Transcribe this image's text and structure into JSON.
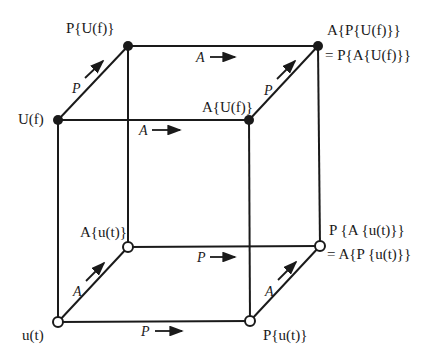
{
  "diagram": {
    "title": "",
    "vertices": {
      "top_front_left": {
        "label": "U(f)",
        "style": "filled"
      },
      "top_back_left": {
        "label": "P{U(f)}",
        "style": "filled"
      },
      "top_front_right": {
        "label": "A{U(f)}",
        "style": "filled"
      },
      "top_back_right": {
        "label_line1": "A{P{U(f)}}",
        "label_line2": "= P{A{U(f)}}",
        "style": "filled"
      },
      "bottom_front_left": {
        "label": "u(t)",
        "style": "open"
      },
      "bottom_back_left": {
        "label": "A{u(t)}",
        "style": "open"
      },
      "bottom_front_right": {
        "label": "P{u(t)}",
        "style": "open"
      },
      "bottom_back_right": {
        "label_line1": "P {A {u(t)}}",
        "label_line2": "= A{P {u(t)}}",
        "style": "open"
      }
    },
    "edge_labels": {
      "top_back": "A",
      "top_front": "A",
      "top_left_diag": "P",
      "top_right_diag": "P",
      "bottom_back": "P",
      "bottom_front": "P",
      "bottom_left_diag": "A",
      "bottom_right_diag": "A"
    }
  }
}
